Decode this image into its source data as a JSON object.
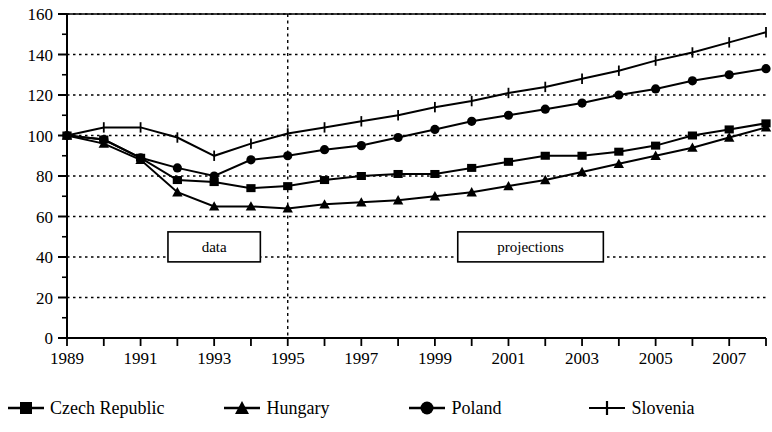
{
  "chart_data": {
    "type": "line",
    "title": "",
    "subtitle": "",
    "xlabel": "",
    "ylabel": "",
    "xlim": [
      1989,
      2008
    ],
    "ylim": [
      0,
      160
    ],
    "ytick_step": 20,
    "yticks": [
      0,
      20,
      40,
      60,
      80,
      100,
      120,
      140,
      160
    ],
    "minor_ytick_step": 10,
    "xticks": [
      1989,
      1990,
      1991,
      1992,
      1993,
      1994,
      1995,
      1996,
      1997,
      1998,
      1999,
      2000,
      2001,
      2002,
      2003,
      2004,
      2005,
      2006,
      2007,
      2008
    ],
    "xtick_labels": [
      "1989",
      "",
      "1991",
      "",
      "1993",
      "",
      "1995",
      "",
      "1997",
      "",
      "1999",
      "",
      "2001",
      "",
      "2003",
      "",
      "2005",
      "",
      "2007",
      ""
    ],
    "grid": "horizontal-dotted",
    "legend_position": "bottom",
    "x": [
      1989,
      1990,
      1991,
      1992,
      1993,
      1994,
      1995,
      1996,
      1997,
      1998,
      1999,
      2000,
      2001,
      2002,
      2003,
      2004,
      2005,
      2006,
      2007,
      2008
    ],
    "series": [
      {
        "name": "Czech Republic",
        "marker": "square",
        "values": [
          100,
          98,
          89,
          78,
          77,
          74,
          75,
          78,
          80,
          81,
          81,
          84,
          87,
          90,
          90,
          92,
          95,
          100,
          103,
          106
        ]
      },
      {
        "name": "Hungary",
        "marker": "triangle",
        "values": [
          100,
          96,
          88,
          72,
          65,
          65,
          64,
          66,
          67,
          68,
          70,
          72,
          75,
          78,
          82,
          86,
          90,
          94,
          99,
          104
        ]
      },
      {
        "name": "Poland",
        "marker": "circle",
        "values": [
          100,
          98,
          89,
          84,
          80,
          88,
          90,
          93,
          95,
          99,
          103,
          107,
          110,
          113,
          116,
          120,
          123,
          127,
          130,
          133
        ]
      },
      {
        "name": "Slovenia",
        "marker": "plus",
        "values": [
          100,
          104,
          104,
          99,
          90,
          96,
          101,
          104,
          107,
          110,
          114,
          117,
          121,
          124,
          128,
          132,
          137,
          141,
          146,
          151
        ]
      }
    ],
    "annotations": [
      {
        "text": "data",
        "x_center": 1993.0,
        "y_center": 45,
        "boxed": true
      },
      {
        "text": "projections",
        "x_center": 2001.6,
        "y_center": 45,
        "boxed": true
      }
    ],
    "divider": {
      "x": 1995,
      "style": "dashed-vertical"
    }
  },
  "legend": {
    "items": [
      {
        "label": "Czech Republic",
        "marker": "square-marker-icon"
      },
      {
        "label": "Hungary",
        "marker": "triangle-marker-icon"
      },
      {
        "label": "Poland",
        "marker": "circle-marker-icon"
      },
      {
        "label": "Slovenia",
        "marker": "plus-marker-icon"
      }
    ]
  },
  "colors": {
    "line": "#000000",
    "grid": "#000000",
    "background": "#ffffff"
  }
}
